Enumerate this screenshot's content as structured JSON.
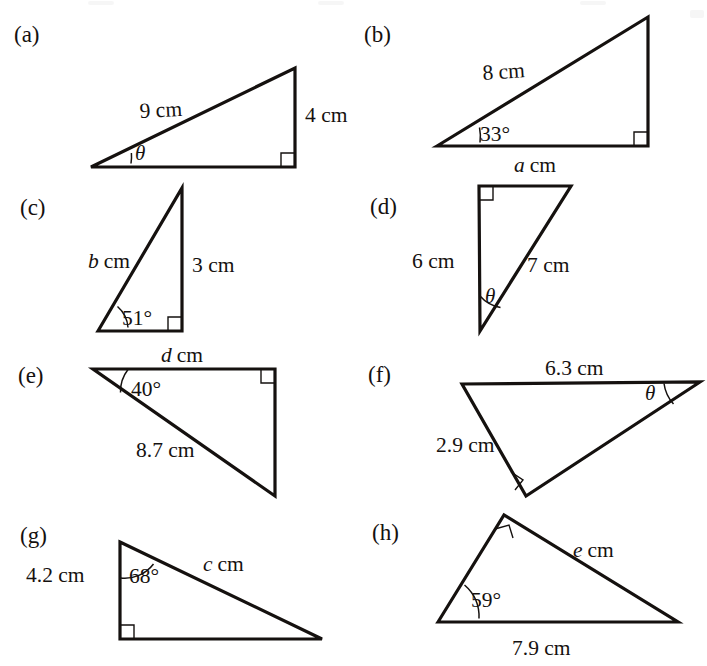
{
  "sheet": {
    "title": "Right-angled triangle exercise figures",
    "background_color": "#ffffff",
    "ink_color": "#15110f",
    "width": 707,
    "height": 666
  },
  "figures": [
    {
      "id": "a",
      "part_label": "(a)",
      "description": "Right triangle, right angle at lower right, hypotenuse rising left to right",
      "labels": {
        "hypotenuse": "9 cm",
        "vertical_side": "4 cm",
        "angle": "θ"
      },
      "angle_marker": "arc",
      "right_angle_marker": "square"
    },
    {
      "id": "b",
      "part_label": "(b)",
      "description": "Right triangle, right angle at lower right, angle 33 degrees at lower left",
      "labels": {
        "hypotenuse": "8 cm",
        "angle": "33°",
        "base": "a cm",
        "base_variable": "a",
        "base_unit": "cm"
      },
      "angle_marker": "arc",
      "right_angle_marker": "square"
    },
    {
      "id": "c",
      "part_label": "(c)",
      "description": "Tall narrow right triangle, right angle at lower right, angle 51 degrees at lower left",
      "labels": {
        "hypotenuse": "b cm",
        "hypotenuse_variable": "b",
        "hypotenuse_unit": "cm",
        "vertical_side": "3 cm",
        "angle": "51°"
      },
      "angle_marker": "arc",
      "right_angle_marker": "square"
    },
    {
      "id": "d",
      "part_label": "(d)",
      "description": "Tall right triangle, right angle at top left, theta at bottom vertex",
      "labels": {
        "vertical_side": "6 cm",
        "hypotenuse": "7 cm",
        "angle": "θ"
      },
      "angle_marker": "arc",
      "right_angle_marker": "square"
    },
    {
      "id": "e",
      "part_label": "(e)",
      "description": "Right triangle, right angle at top right, angle 40 degrees at top left",
      "labels": {
        "top_side": "d cm",
        "top_side_variable": "d",
        "top_side_unit": "cm",
        "hypotenuse": "8.7 cm",
        "angle": "40°"
      },
      "angle_marker": "arc",
      "right_angle_marker": "square"
    },
    {
      "id": "f",
      "part_label": "(f)",
      "description": "Obtuse-looking right triangle, right angle at bottom vertex, theta at right vertex",
      "labels": {
        "top_side": "6.3 cm",
        "left_side": "2.9 cm",
        "angle": "θ"
      },
      "angle_marker": "arc",
      "right_angle_marker": "square"
    },
    {
      "id": "g",
      "part_label": "(g)",
      "description": "Right triangle, right angle at lower left, angle 68 degrees at top vertex",
      "labels": {
        "vertical_side": "4.2 cm",
        "angle": "68°",
        "hypotenuse": "c cm",
        "hypotenuse_variable": "c",
        "hypotenuse_unit": "cm"
      },
      "angle_marker": "arc",
      "right_angle_marker": "square"
    },
    {
      "id": "h",
      "part_label": "(h)",
      "description": "Right triangle, right angle at top vertex, angle 59 degrees at lower left",
      "labels": {
        "hypotenuse": "e cm",
        "hypotenuse_variable": "e",
        "hypotenuse_unit": "cm",
        "angle": "59°",
        "base": "7.9 cm"
      },
      "angle_marker": "arc",
      "right_angle_marker": "square"
    }
  ]
}
